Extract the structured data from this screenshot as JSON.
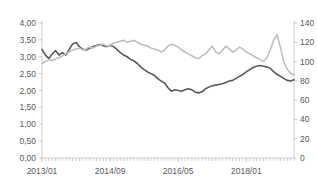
{
  "chart_data": {
    "type": "line",
    "title": "",
    "subtitle": "",
    "xlabel": "",
    "ylabel": "",
    "y2label": "",
    "grid": false,
    "legend": "none",
    "x_tick_labels": [
      "2013/01",
      "2014/09",
      "2016/05",
      "2018/01"
    ],
    "x_tick_indices": [
      0,
      20,
      40,
      60
    ],
    "x_range": [
      "2013/01",
      "2018/11"
    ],
    "ylim": [
      0,
      4
    ],
    "y_ticks": [
      0,
      0.5,
      1,
      1.5,
      2,
      2.5,
      3,
      3.5,
      4
    ],
    "y_tick_labels": [
      "0,00",
      "0,50",
      "1,00",
      "1,50",
      "2,00",
      "2,50",
      "3,00",
      "3,50",
      "4,00"
    ],
    "y2lim": [
      0,
      140
    ],
    "y2_ticks": [
      0,
      20,
      40,
      60,
      80,
      100,
      120,
      140
    ],
    "y2_tick_labels": [
      "0",
      "20",
      "40",
      "60",
      "80",
      "100",
      "120",
      "140"
    ],
    "series": [
      {
        "name": "dark-series",
        "axis": "left",
        "color": "#595959",
        "width": 1.6,
        "values": [
          3.22,
          3.05,
          2.95,
          3.08,
          3.18,
          3.05,
          3.12,
          3.05,
          3.22,
          3.38,
          3.42,
          3.3,
          3.22,
          3.2,
          3.25,
          3.3,
          3.33,
          3.36,
          3.33,
          3.3,
          3.34,
          3.3,
          3.22,
          3.12,
          3.05,
          3.0,
          2.92,
          2.88,
          2.8,
          2.7,
          2.62,
          2.55,
          2.5,
          2.45,
          2.35,
          2.28,
          2.22,
          2.08,
          1.98,
          2.02,
          2.0,
          1.98,
          2.02,
          2.05,
          2.02,
          1.95,
          1.93,
          1.96,
          2.05,
          2.1,
          2.14,
          2.16,
          2.18,
          2.2,
          2.24,
          2.28,
          2.3,
          2.36,
          2.42,
          2.48,
          2.55,
          2.62,
          2.68,
          2.72,
          2.74,
          2.72,
          2.7,
          2.66,
          2.56,
          2.48,
          2.42,
          2.36,
          2.3,
          2.28,
          2.32
        ]
      },
      {
        "name": "light-series",
        "axis": "right",
        "color": "#bfbfbf",
        "width": 1.6,
        "values": [
          98,
          100,
          102,
          101,
          103,
          104,
          106,
          108,
          110,
          112,
          113,
          114,
          112,
          113,
          115,
          114,
          116,
          117,
          118,
          116,
          117,
          119,
          120,
          121,
          122,
          120,
          121,
          122,
          120,
          118,
          117,
          116,
          114,
          113,
          112,
          110,
          112,
          116,
          118,
          117,
          115,
          112,
          110,
          108,
          106,
          104,
          103,
          106,
          108,
          112,
          116,
          110,
          108,
          112,
          116,
          113,
          110,
          112,
          115,
          113,
          110,
          108,
          106,
          104,
          102,
          100,
          104,
          112,
          122,
          128,
          115,
          100,
          92,
          88,
          86
        ]
      }
    ]
  }
}
